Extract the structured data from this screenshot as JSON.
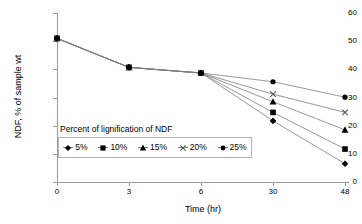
{
  "chart_data": {
    "type": "line",
    "title": "",
    "subtitle": "",
    "xlabel": "Time (hr)",
    "ylabel": "NDF, % of sample wt",
    "categories": [
      "0",
      "3",
      "6",
      "30",
      "48"
    ],
    "x": [
      0,
      3,
      6,
      30,
      48
    ],
    "ylim": [
      0,
      60
    ],
    "yticks": [
      0,
      10,
      20,
      30,
      40,
      50,
      60
    ],
    "ytick_labels": [
      "0",
      "10",
      "20",
      "30",
      "40",
      "50",
      "60"
    ],
    "xtick_labels": [
      "0",
      "3",
      "6",
      "30",
      "48"
    ],
    "grid": false,
    "legend_position": "inside-lower-left",
    "legend_title": "Percent of lignification of NDF",
    "series": [
      {
        "name": "5%",
        "marker": "diamond",
        "values": [
          51.0,
          40.7,
          38.7,
          21.7,
          6.5
        ]
      },
      {
        "name": "10%",
        "marker": "square",
        "values": [
          51.0,
          40.7,
          38.7,
          24.7,
          11.7
        ]
      },
      {
        "name": "15%",
        "marker": "triangle",
        "values": [
          51.0,
          40.7,
          38.7,
          28.5,
          18.5
        ]
      },
      {
        "name": "20%",
        "marker": "cross",
        "values": [
          51.0,
          40.7,
          38.7,
          31.2,
          24.7
        ]
      },
      {
        "name": "25%",
        "marker": "circle",
        "values": [
          51.0,
          40.7,
          38.7,
          35.6,
          30.1
        ]
      }
    ],
    "colors": {
      "line": "#7d7d7d",
      "marker": "#000000",
      "axis": "#9a9a9a",
      "legend_border": "#b4b4b4"
    }
  },
  "legend": {
    "title": "Percent of lignification of NDF",
    "entries": [
      {
        "label": "5%",
        "marker": "diamond-marker-icon"
      },
      {
        "label": "10%",
        "marker": "square-marker-icon"
      },
      {
        "label": "15%",
        "marker": "triangle-marker-icon"
      },
      {
        "label": "20%",
        "marker": "cross-marker-icon"
      },
      {
        "label": "25%",
        "marker": "circle-marker-icon"
      }
    ]
  },
  "axes": {
    "y_title": "NDF, % of sample wt",
    "x_title": "Time (hr)",
    "y_labels": [
      "60",
      "50",
      "40",
      "30",
      "20",
      "10",
      "0"
    ],
    "x_labels": [
      "0",
      "3",
      "6",
      "30",
      "48"
    ]
  }
}
